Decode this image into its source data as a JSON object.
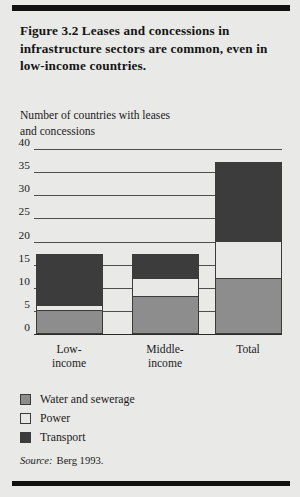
{
  "figure": {
    "title": "Figure 3.2  Leases and concessions in infrastructure sectors are common, even in low-income countries.",
    "axis_title_line1": "Number of countries with leases",
    "axis_title_line2": "and concessions",
    "source_label": "Source:",
    "source_value": "Berg 1993."
  },
  "colors": {
    "water": "#8d8d8d",
    "power": "#e8e8e6",
    "transport": "#3c3c3c",
    "gridline": "#4e4e4e",
    "rule": "#111111",
    "background": "#e9e9e7"
  },
  "legend": [
    {
      "label": "Water and sewerage",
      "color": "#8d8d8d",
      "key": "water"
    },
    {
      "label": "Power",
      "color": "#e8e8e6",
      "key": "power"
    },
    {
      "label": "Transport",
      "color": "#3c3c3c",
      "key": "transport"
    }
  ],
  "chart_data": {
    "type": "bar",
    "subtype": "stacked-vertical",
    "title": "Figure 3.2  Leases and concessions in infrastructure sectors are common, even in low-income countries.",
    "ylabel": "Number of countries with leases and concessions",
    "xlabel": "",
    "categories": [
      "Low-income",
      "Middle-income",
      "Total"
    ],
    "series": [
      {
        "name": "Water and sewerage",
        "values": [
          5,
          8,
          12
        ]
      },
      {
        "name": "Power",
        "values": [
          1,
          4,
          8
        ]
      },
      {
        "name": "Transport",
        "values": [
          11,
          5,
          17
        ]
      }
    ],
    "totals": [
      17,
      17,
      37
    ],
    "ylim": [
      0,
      40
    ],
    "yticks": [
      0,
      5,
      10,
      15,
      20,
      25,
      30,
      35,
      40
    ],
    "ytick_labels": [
      "0",
      "5",
      "10",
      "15",
      "20",
      "25",
      "30",
      "35",
      "40"
    ],
    "grid": true,
    "legend_position": "below-left",
    "source": "Berg 1993."
  }
}
